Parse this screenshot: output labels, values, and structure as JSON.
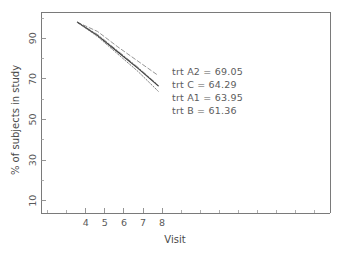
{
  "chart_data": {
    "type": "line",
    "title": "",
    "xlabel": "Visit",
    "ylabel": "% of subjects in study",
    "xlim": [
      2.2,
      16.5
    ],
    "ylim": [
      2,
      100
    ],
    "xticks": [
      4,
      5,
      6,
      7,
      8
    ],
    "xtick_labels": [
      "4",
      "5",
      "6",
      "7",
      "8"
    ],
    "yticks": [
      10,
      30,
      50,
      70,
      90
    ],
    "ytick_labels": [
      "10",
      "30",
      "50",
      "70",
      "90"
    ],
    "grid": false,
    "legend_position": "inside-annotation",
    "x": [
      4,
      5,
      6,
      7,
      8
    ],
    "series": [
      {
        "name": "trt A2",
        "final_value": 69.05,
        "style": "dashed",
        "color": "#8a8a8a",
        "values": [
          95.0,
          90.5,
          83.0,
          76.0,
          69.05
        ]
      },
      {
        "name": "trt C",
        "final_value": 64.29,
        "style": "dash-dot",
        "color": "#7d7d7d",
        "values": [
          95.0,
          89.0,
          81.0,
          73.0,
          64.29
        ]
      },
      {
        "name": "trt A1",
        "final_value": 63.95,
        "style": "solid",
        "color": "#3a3a3a",
        "values": [
          95.0,
          88.5,
          80.5,
          72.5,
          63.95
        ]
      },
      {
        "name": "trt B",
        "final_value": 61.36,
        "style": "dotted",
        "color": "#6f6f6f",
        "values": [
          95.0,
          88.0,
          79.5,
          71.0,
          61.36
        ]
      }
    ],
    "annotations": [
      "trt A2 = 69.05",
      "trt C = 64.29",
      "trt A1 = 63.95",
      "trt B = 61.36"
    ]
  },
  "annotation_lines": {
    "line1": "trt A2 = 69.05",
    "line2": "trt C = 64.29",
    "line3": "trt A1 = 63.95",
    "line4": "trt B = 61.36"
  },
  "axes": {
    "x_title": "Visit",
    "y_title": "% of subjects in study",
    "x_labels": {
      "t4": "4",
      "t5": "5",
      "t6": "6",
      "t7": "7",
      "t8": "8"
    },
    "y_labels": {
      "t10": "10",
      "t30": "30",
      "t50": "50",
      "t70": "70",
      "t90": "90"
    }
  },
  "colors": {
    "frame": "#7a7a7a",
    "text": "#5a5a5a",
    "curve_solid": "#3a3a3a",
    "curve_dashed": "#8a8a8a",
    "background": "#ffffff"
  }
}
